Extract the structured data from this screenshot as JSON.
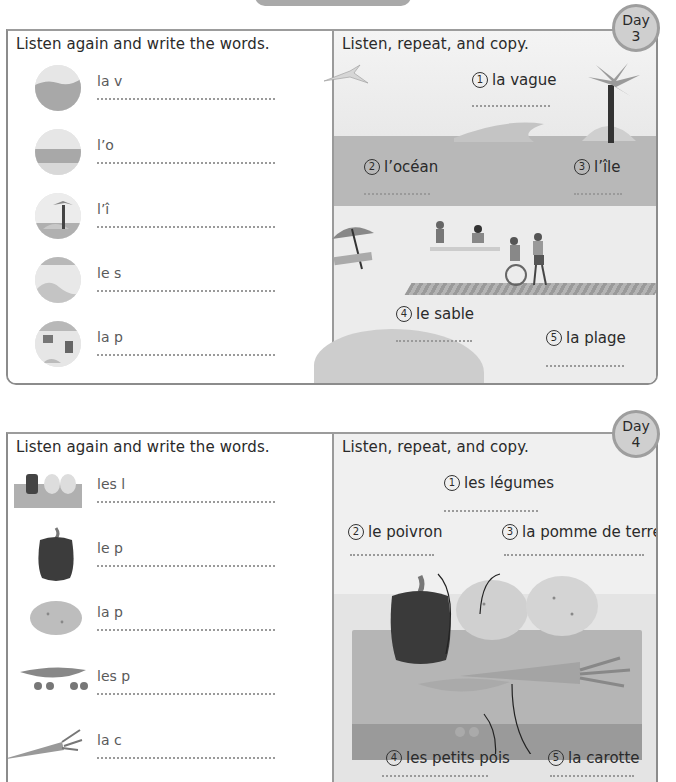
{
  "page": {
    "top_tab": ""
  },
  "day3": {
    "badge": {
      "label": "Day",
      "number": "3"
    },
    "left": {
      "heading": "Listen again and write the words.",
      "rows": [
        {
          "word": "la v",
          "icon": "wave-icon"
        },
        {
          "word": "l’o",
          "icon": "ocean-icon"
        },
        {
          "word": "l’î",
          "icon": "island-icon"
        },
        {
          "word": "le s",
          "icon": "sand-icon"
        },
        {
          "word": "la p",
          "icon": "beach-icon"
        }
      ]
    },
    "right": {
      "heading": "Listen, repeat, and copy.",
      "items": [
        {
          "num": "1",
          "label": "la vague"
        },
        {
          "num": "2",
          "label": "l’océan"
        },
        {
          "num": "3",
          "label": "l’île"
        },
        {
          "num": "4",
          "label": "le sable"
        },
        {
          "num": "5",
          "label": "la plage"
        }
      ]
    }
  },
  "day4": {
    "badge": {
      "label": "Day",
      "number": "4"
    },
    "left": {
      "heading": "Listen again and write the words.",
      "rows": [
        {
          "word": "les l",
          "icon": "vegetables-icon"
        },
        {
          "word": "le p",
          "icon": "pepper-icon"
        },
        {
          "word": "la p",
          "icon": "potato-icon"
        },
        {
          "word": "les p",
          "icon": "peas-icon"
        },
        {
          "word": "la c",
          "icon": "carrot-icon"
        }
      ]
    },
    "right": {
      "heading": "Listen, repeat, and copy.",
      "items": [
        {
          "num": "1",
          "label": "les légumes"
        },
        {
          "num": "2",
          "label": "le poivron"
        },
        {
          "num": "3",
          "label": "la pomme de terre"
        },
        {
          "num": "4",
          "label": "les petits pois"
        },
        {
          "num": "5",
          "label": "la carotte"
        }
      ]
    }
  }
}
